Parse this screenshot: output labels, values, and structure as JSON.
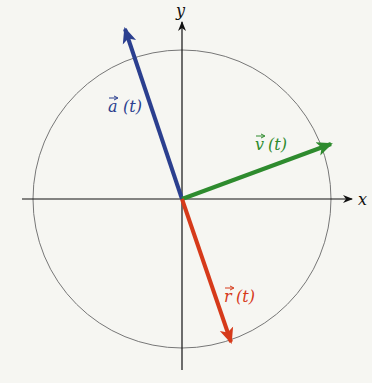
{
  "diagram": {
    "type": "vector-diagram",
    "axes": {
      "x_label": "x",
      "y_label": "y"
    },
    "vectors": [
      {
        "name": "acceleration",
        "label": "a (t)",
        "color": "#2b3f8f"
      },
      {
        "name": "velocity",
        "label": "v (t)",
        "color": "#2e8b2e"
      },
      {
        "name": "position",
        "label": "r (t)",
        "color": "#d63a1a"
      }
    ],
    "labels": {
      "a_symbol": "a",
      "a_arg": "(t)",
      "v_symbol": "v",
      "v_arg": "(t)",
      "r_symbol": "r",
      "r_arg": "(t)"
    }
  }
}
